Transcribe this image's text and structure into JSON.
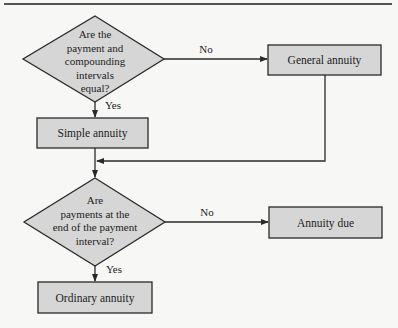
{
  "flowchart": {
    "decision1": {
      "text": "Are the\npayment and\ncompounding\nintervals\nequal?",
      "yes_label": "Yes",
      "no_label": "No"
    },
    "general_annuity": {
      "label": "General annuity"
    },
    "simple_annuity": {
      "label": "Simple annuity"
    },
    "decision2": {
      "text": "Are\npayments at the\nend of the payment\ninterval?",
      "yes_label": "Yes",
      "no_label": "No"
    },
    "annuity_due": {
      "label": "Annuity due"
    },
    "ordinary_annuity": {
      "label": "Ordinary annuity"
    }
  },
  "colors": {
    "shape_fill": "#d6d6d6",
    "stroke": "#2a2a2a",
    "background": "#f7f7f5"
  }
}
